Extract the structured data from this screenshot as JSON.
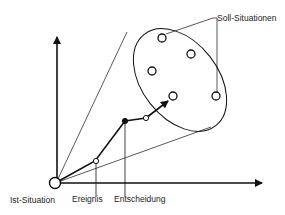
{
  "diagram": {
    "labels": {
      "target_situations": "Soll-Situationen",
      "current_situation": "Ist-Situation",
      "event": "Ereignis",
      "decision": "Entscheidung"
    },
    "target_situation_count": 5,
    "colors": {
      "stroke": "#111111",
      "background": "#ffffff",
      "text": "#222222"
    }
  }
}
